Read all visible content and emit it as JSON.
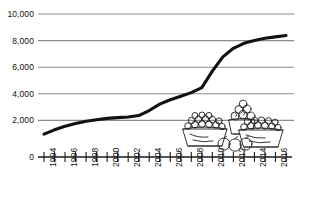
{
  "chart_data": {
    "type": "line",
    "title": "",
    "subtitle": "",
    "xlabel": "",
    "ylabel": "",
    "xlim": [
      1994,
      2017
    ],
    "ylim": [
      0,
      10000
    ],
    "grid": true,
    "legend": null,
    "y_ticks": [
      0,
      2000,
      4000,
      6000,
      8000,
      10000
    ],
    "y_tick_labels": [
      "0",
      "2,000",
      "4,000",
      "6,000",
      "8,000",
      "10,000"
    ],
    "x_ticks": [
      1994,
      1995,
      1996,
      1997,
      1998,
      1999,
      2000,
      2001,
      2002,
      2003,
      2004,
      2005,
      2006,
      2007,
      2008,
      2009,
      2010,
      2011,
      2012,
      2013,
      2014,
      2015,
      2016,
      2017
    ],
    "x_tick_labels": [
      "1994",
      "",
      "1996",
      "",
      "1998",
      "",
      "2000",
      "",
      "2002",
      "",
      "2004",
      "",
      "2006",
      "",
      "2008",
      "",
      "2010",
      "",
      "2012",
      "",
      "2014",
      "",
      "2016",
      ""
    ],
    "x": [
      1994,
      1995,
      1996,
      1997,
      1998,
      1999,
      2000,
      2001,
      2002,
      2003,
      2004,
      2005,
      2006,
      2007,
      2008,
      2009,
      2010,
      2011,
      2012,
      2013,
      2014,
      2015,
      2016,
      2017
    ],
    "values": [
      1600,
      1900,
      2150,
      2350,
      2500,
      2600,
      2700,
      2750,
      2800,
      2900,
      3250,
      3700,
      4000,
      4250,
      4500,
      4850,
      6000,
      7000,
      7600,
      7950,
      8150,
      8300,
      8400,
      8500
    ],
    "series": [
      {
        "name": "series-1",
        "color": "#111111",
        "values": [
          1600,
          1900,
          2150,
          2350,
          2500,
          2600,
          2700,
          2750,
          2800,
          2900,
          3250,
          3700,
          4000,
          4250,
          4500,
          4850,
          6000,
          7000,
          7600,
          7950,
          8150,
          8300,
          8400,
          8500
        ]
      }
    ],
    "annotations": [
      {
        "name": "fruit-baskets-illustration",
        "description": "hand-drawn baskets of fruit"
      }
    ]
  },
  "axis": {
    "gridline_color": "#8c8c8c",
    "axis_color": "#1a1a1a",
    "line_color": "#111111",
    "background": "#ffffff"
  },
  "illustration": {
    "name": "fruit-baskets-illustration",
    "caption": ""
  }
}
